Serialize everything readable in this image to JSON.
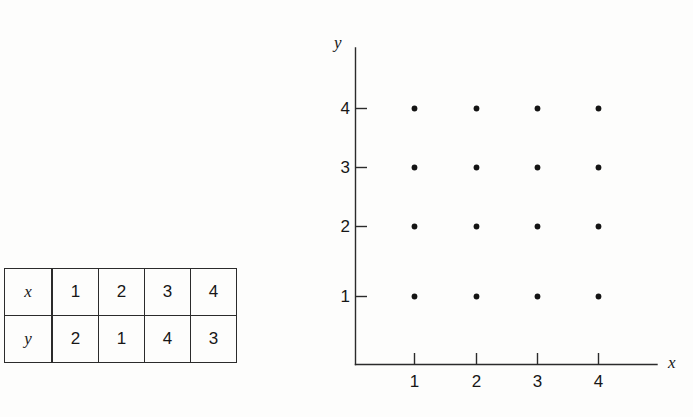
{
  "figure": {
    "kind": "table-and-scatter-plot"
  },
  "table": {
    "row_labels": [
      "x",
      "y"
    ],
    "rows": [
      {
        "label": "x",
        "values": [
          "1",
          "2",
          "3",
          "4"
        ]
      },
      {
        "label": "y",
        "values": [
          "2",
          "1",
          "4",
          "3"
        ]
      }
    ]
  },
  "plot": {
    "xlabel": "x",
    "ylabel": "y",
    "x_ticks": [
      "1",
      "2",
      "3",
      "4"
    ],
    "y_ticks": [
      "1",
      "2",
      "3",
      "4"
    ],
    "axis_color": "#2b2b2b",
    "dot_color": "#141414"
  },
  "chart_data": {
    "type": "scatter",
    "title": "",
    "xlabel": "x",
    "ylabel": "y",
    "xlim": [
      0,
      5
    ],
    "ylim": [
      0,
      5
    ],
    "x_ticks": [
      1,
      2,
      3,
      4
    ],
    "y_ticks": [
      1,
      2,
      3,
      4
    ],
    "grid": false,
    "legend": "none",
    "series": [
      {
        "name": "lattice points",
        "points": [
          {
            "x": 1,
            "y": 1
          },
          {
            "x": 1,
            "y": 2
          },
          {
            "x": 1,
            "y": 3
          },
          {
            "x": 1,
            "y": 4
          },
          {
            "x": 2,
            "y": 1
          },
          {
            "x": 2,
            "y": 2
          },
          {
            "x": 2,
            "y": 3
          },
          {
            "x": 2,
            "y": 4
          },
          {
            "x": 3,
            "y": 1
          },
          {
            "x": 3,
            "y": 2
          },
          {
            "x": 3,
            "y": 3
          },
          {
            "x": 3,
            "y": 4
          },
          {
            "x": 4,
            "y": 1
          },
          {
            "x": 4,
            "y": 2
          },
          {
            "x": 4,
            "y": 3
          },
          {
            "x": 4,
            "y": 4
          }
        ]
      }
    ],
    "table": {
      "row_labels": [
        "x",
        "y"
      ],
      "x": [
        1,
        2,
        3,
        4
      ],
      "y": [
        2,
        1,
        4,
        3
      ]
    }
  }
}
